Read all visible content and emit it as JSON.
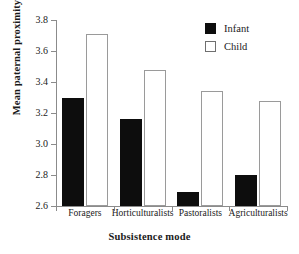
{
  "chart_data": {
    "type": "bar",
    "title": "",
    "xlabel": "Subsistence mode",
    "ylabel": "Mean paternal proximity",
    "categories": [
      "Foragers",
      "Horticulturalists",
      "Pastoralists",
      "Agriculturalists"
    ],
    "series": [
      {
        "name": "Infant",
        "values": [
          3.3,
          3.16,
          2.69,
          2.8
        ],
        "color": "#0d0d0d"
      },
      {
        "name": "Child",
        "values": [
          3.71,
          3.48,
          3.34,
          3.28
        ],
        "color": "#ffffff"
      }
    ],
    "ylim": [
      2.6,
      3.8
    ],
    "yticks": [
      2.6,
      2.8,
      3.0,
      3.2,
      3.4,
      3.6,
      3.8
    ],
    "ytick_labels": [
      "2.6",
      "2.8",
      "3.0",
      "3.2",
      "3.4",
      "3.6",
      "3.8"
    ],
    "grid": false,
    "legend_position": "top-right"
  },
  "legend": {
    "entries": [
      {
        "label": "Infant",
        "swatch": "filled-square"
      },
      {
        "label": "Child",
        "swatch": "open-square"
      }
    ]
  },
  "axes": {
    "x_title": "Subsistence mode",
    "y_title": "Mean paternal proximity"
  }
}
